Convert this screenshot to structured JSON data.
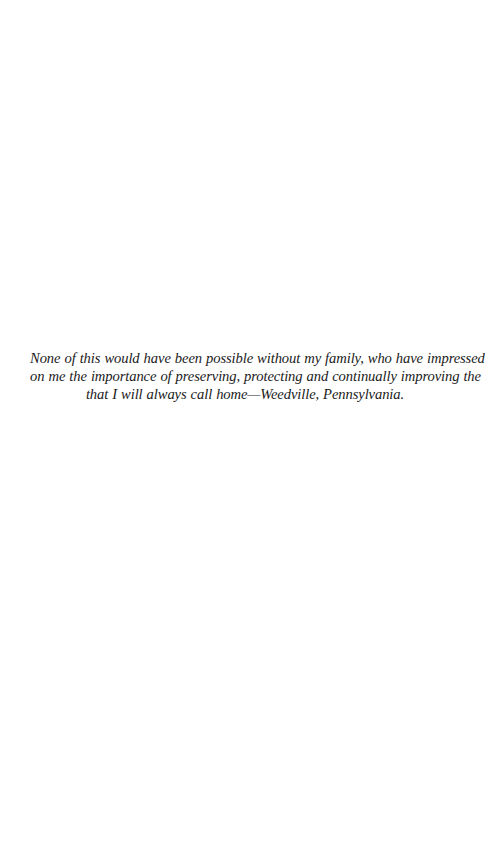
{
  "page": {
    "type": "dedication",
    "background_color": "#ffffff",
    "text_color": "#1a1a1a"
  },
  "dedication": {
    "lines": [
      "None of this would have been possible without my family, who have impressed",
      "on me the importance of preserving, protecting and continually improving the area",
      "that I will always call home—Weedville, Pennsylvania."
    ]
  }
}
